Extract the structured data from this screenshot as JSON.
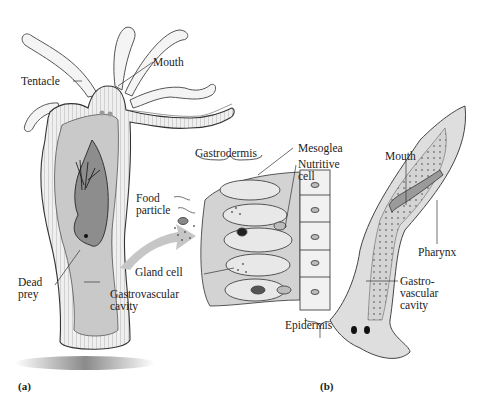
{
  "figure": {
    "panels": [
      {
        "id": "a",
        "label": "(a)",
        "organism_depicted": "hydra"
      },
      {
        "id": "b",
        "label": "(b)",
        "organism_depicted": "planarian"
      }
    ]
  },
  "panel_a": {
    "labels": {
      "mouth": "Mouth",
      "tentacle": "Tentacle",
      "gastrodermis": "Gastrodermis",
      "mesoglea": "Mesoglea",
      "nutritive_cell_1": "Nutritive",
      "nutritive_cell_2": "cell",
      "food_particle_1": "Food",
      "food_particle_2": "particle",
      "gland_cell": "Gland cell",
      "dead_prey_1": "Dead",
      "dead_prey_2": "prey",
      "gastrovascular_cavity_1": "Gastrovascular",
      "gastrovascular_cavity_2": "cavity",
      "epidermis": "Epidermis"
    }
  },
  "panel_b": {
    "labels": {
      "mouth": "Mouth",
      "pharynx": "Pharynx",
      "gastrovascular_1": "Gastro-",
      "gastrovascular_2": "vascular",
      "gastrovascular_3": "cavity"
    }
  },
  "colors": {
    "body_fill": "#cfcfcf",
    "tissue_fill": "#e8e8e8",
    "cavity_fill": "#bdbdbd",
    "prey_fill": "#8a8a8a",
    "arrow_fill": "#c8c8c8",
    "outline": "#3a3a3a"
  }
}
